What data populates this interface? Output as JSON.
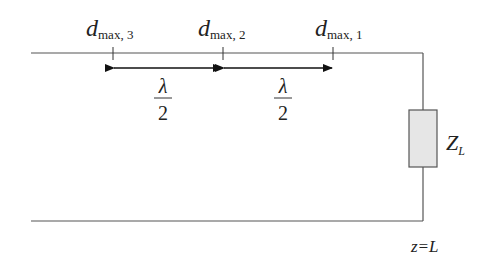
{
  "diagram": {
    "type": "transmission-line standing-wave maxima",
    "labels": {
      "dmax3": {
        "main": "d",
        "sub": "max, 3"
      },
      "dmax2": {
        "main": "d",
        "sub": "max, 2"
      },
      "dmax1": {
        "main": "d",
        "sub": "max, 1"
      },
      "spacing1": {
        "num": "λ",
        "den": "2"
      },
      "spacing2": {
        "num": "λ",
        "den": "2"
      },
      "load": {
        "main": "Z",
        "sub": "L"
      },
      "position": "z=L"
    },
    "colors": {
      "line": "#555555",
      "load_fill": "#e6e6e6",
      "load_stroke": "#555555",
      "text": "#222222"
    }
  }
}
